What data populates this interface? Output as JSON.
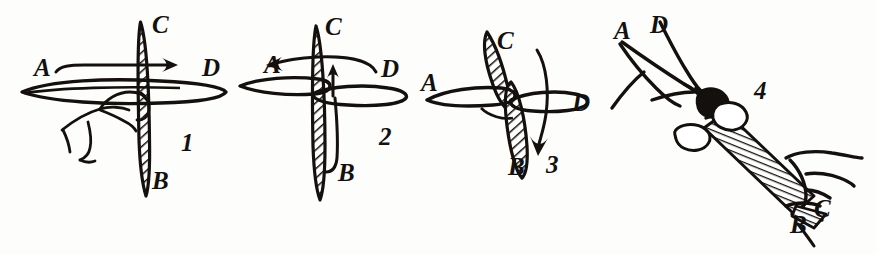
{
  "figure": {
    "ink_color": "#14100e",
    "background_color": "#fdfdfc",
    "panel_count": 4
  },
  "panels": [
    {
      "number": "1",
      "number_pos": {
        "x": 181,
        "y": 130
      },
      "description": "Vertical hatched disc on horizontal axle, hand grasping axle at centre, straight arrow from A to D pointing right",
      "arrow": "straight-right-arrow",
      "labels": [
        {
          "text": "C",
          "x": 152,
          "y": 12
        },
        {
          "text": "A",
          "x": 34,
          "y": 55
        },
        {
          "text": "D",
          "x": 202,
          "y": 55
        },
        {
          "text": "B",
          "x": 152,
          "y": 168
        }
      ]
    },
    {
      "number": "2",
      "number_pos": {
        "x": 379,
        "y": 124
      },
      "description": "Vertical hatched disc with horizontal disc tilted, curved arrow sweeping from D to A at top and short vertical arrow rising from B",
      "arrow": "curved-left-arrow-and-up-arrow",
      "labels": [
        {
          "text": "C",
          "x": 325,
          "y": 14
        },
        {
          "text": "A",
          "x": 264,
          "y": 52
        },
        {
          "text": "D",
          "x": 381,
          "y": 56
        },
        {
          "text": "B",
          "x": 338,
          "y": 160
        }
      ]
    },
    {
      "number": "3",
      "number_pos": {
        "x": 546,
        "y": 152
      },
      "description": "Two crossed discs with long curved arrow sweeping downward on the right-hand side",
      "arrow": "curved-down-arrow",
      "labels": [
        {
          "text": "C",
          "x": 497,
          "y": 28
        },
        {
          "text": "A",
          "x": 421,
          "y": 70
        },
        {
          "text": "D",
          "x": 572,
          "y": 90
        },
        {
          "text": "B",
          "x": 508,
          "y": 154
        }
      ]
    },
    {
      "number": "4",
      "number_pos": {
        "x": 754,
        "y": 78
      },
      "description": "Two hands holding the hatched shaft diagonally, upper-left hand at A-D end and lower-right hand at B-C end",
      "arrow": "none",
      "labels": [
        {
          "text": "A",
          "x": 614,
          "y": 18
        },
        {
          "text": "D",
          "x": 650,
          "y": 12
        },
        {
          "text": "C",
          "x": 814,
          "y": 196
        },
        {
          "text": "B",
          "x": 790,
          "y": 212
        }
      ]
    }
  ]
}
